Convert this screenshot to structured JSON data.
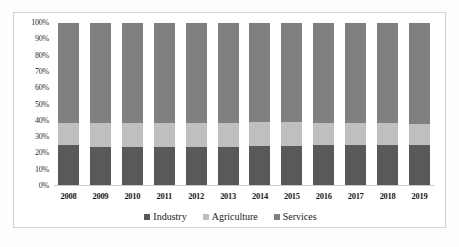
{
  "chart_data": {
    "type": "bar",
    "stacked": true,
    "normalized_percent": true,
    "title": "",
    "subtitle": "",
    "xlabel": "",
    "ylabel": "",
    "ylim": [
      0,
      100
    ],
    "y_ticks": [
      "0%",
      "10%",
      "20%",
      "30%",
      "40%",
      "50%",
      "60%",
      "70%",
      "80%",
      "90%",
      "100%"
    ],
    "y_tick_values": [
      0,
      10,
      20,
      30,
      40,
      50,
      60,
      70,
      80,
      90,
      100
    ],
    "grid": false,
    "legend_position": "bottom",
    "categories": [
      "2008",
      "2009",
      "2010",
      "2011",
      "2012",
      "2013",
      "2014",
      "2015",
      "2016",
      "2017",
      "2018",
      "2019"
    ],
    "series": [
      {
        "name": "Industry",
        "color": "#595959",
        "values": [
          24.5,
          23.3,
          23.5,
          23.3,
          23.3,
          23.3,
          24.0,
          24.3,
          24.5,
          25.0,
          25.0,
          25.0
        ]
      },
      {
        "name": "Agriculture",
        "color": "#bfbfbf",
        "values": [
          14.0,
          15.2,
          15.0,
          15.2,
          15.0,
          15.0,
          15.0,
          14.5,
          14.0,
          13.5,
          13.0,
          12.5
        ]
      },
      {
        "name": "Services",
        "color": "#808080",
        "values": [
          61.5,
          61.5,
          61.5,
          61.5,
          61.7,
          61.7,
          61.0,
          61.2,
          61.5,
          61.5,
          62.0,
          62.5
        ]
      }
    ]
  },
  "legend": {
    "items": [
      {
        "label": "Industry",
        "color": "#595959"
      },
      {
        "label": "Agriculture",
        "color": "#bfbfbf"
      },
      {
        "label": "Services",
        "color": "#808080"
      }
    ]
  },
  "colors": {
    "industry": "#595959",
    "agriculture": "#bfbfbf",
    "services": "#808080",
    "axis_line": "#c8c8c8",
    "frame_border": "#d2d2d2",
    "plot_background": "#ffffff",
    "text": "#1a1a1a"
  }
}
